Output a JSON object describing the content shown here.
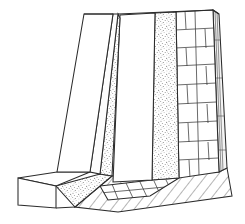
{
  "figure": {
    "title": "Axonometric line drawing of a buttressed retaining wall",
    "domain": "Diagram",
    "background_color": "#ffffff",
    "line_color": "#2b2b2b",
    "canvas": {
      "width": 245,
      "height": 224
    },
    "caption": "",
    "annotations": []
  },
  "style": {
    "stipple_color": "#8a8a8a",
    "stipple_density": "fine",
    "hatch_color": "#3a3a3a",
    "hatch_angle_deg": 38,
    "stroke_width_main": 1.05,
    "stroke_width_detail": 0.7
  },
  "parts": [
    {
      "id": "left-wing-outer",
      "name": "left-wing-wall-outer-face",
      "fill": "#ffffff",
      "texture": "none",
      "points": "57,172 84,14 113,14 90,172"
    },
    {
      "id": "left-wing-inner",
      "name": "left-wing-wall-inner-face",
      "fill": "#ffffff",
      "texture": "none",
      "points": "90,172 113,14 118,14 100,174"
    },
    {
      "id": "left-wedge-stipple",
      "name": "left-stipple-wedge",
      "fill": "#ffffff",
      "texture": "stipple",
      "points": "100,174 118,14 120,18 112,176"
    },
    {
      "id": "center-panel",
      "name": "center-plain-panel",
      "fill": "#ffffff",
      "texture": "none",
      "points": "113,182 120,15 155,13 152,180"
    },
    {
      "id": "stipple-band",
      "name": "center-stipple-band",
      "fill": "#ffffff",
      "texture": "stipple",
      "points": "152,180 155,13 176,12 179,178"
    },
    {
      "id": "brick-face",
      "name": "brick-coursed-face",
      "fill": "#ffffff",
      "texture": "brick",
      "points": "179,178 176,12 213,10 219,172"
    },
    {
      "id": "right-edge",
      "name": "right-side-edge-face",
      "fill": "#f4f4f4",
      "texture": "vertical-lines",
      "points": "219,172 213,10 219,14 227,168"
    },
    {
      "id": "base-left",
      "name": "base-slab-left-top",
      "fill": "#ffffff",
      "texture": "none",
      "points": "18,178 57,172 90,172 56,186"
    },
    {
      "id": "base-left-front",
      "name": "base-slab-left-front",
      "fill": "#ffffff",
      "texture": "none",
      "points": "18,178 56,186 56,208 18,205"
    },
    {
      "id": "base-stipple",
      "name": "base-stipple-strip",
      "fill": "#ffffff",
      "texture": "stipple",
      "points": "56,186 100,174 112,176 75,207"
    },
    {
      "id": "base-hatch",
      "name": "base-hatched-slab",
      "fill": "#ffffff",
      "texture": "hatch",
      "points": "75,207 112,176 219,172 227,168 232,196 118,212"
    },
    {
      "id": "base-blocks",
      "name": "base-block-course",
      "fill": "#ffffff",
      "texture": "blocks",
      "points": "100,186 152,180 179,178 150,196 108,200"
    }
  ],
  "brick_pattern": {
    "name": "running-bond",
    "columns": 2,
    "rows": 9,
    "course_heights": [
      12,
      18,
      18,
      19,
      19,
      19,
      19,
      19,
      19
    ],
    "offset_alternating": true
  },
  "legend": {
    "visible": false,
    "entries": []
  },
  "labels": {
    "visible": false,
    "items": []
  }
}
